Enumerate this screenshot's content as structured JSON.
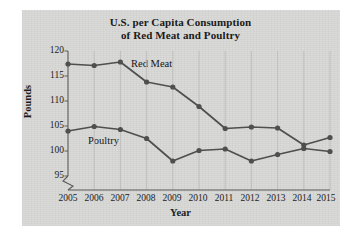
{
  "figure": {
    "title_line1": "U.S. per Capita Consumption",
    "title_line2": "of Red Meat and Poultry",
    "panel_color": "#d9d9d7",
    "ink_color": "#4f4f4f",
    "text_color": "#1c1c1c"
  },
  "chart_data": {
    "type": "line",
    "title": "U.S. per Capita Consumption of Red Meat and Poultry",
    "xlabel": "Year",
    "ylabel": "Pounds",
    "categories": [
      "2005",
      "2006",
      "2007",
      "2008",
      "2009",
      "2010",
      "2011",
      "2012",
      "2013",
      "2014",
      "2015"
    ],
    "x": [
      2005,
      2006,
      2007,
      2008,
      2009,
      2010,
      2011,
      2012,
      2013,
      2014,
      2015
    ],
    "xlim": [
      2005,
      2015
    ],
    "ylim": [
      95,
      120
    ],
    "yticks": [
      95,
      100,
      105,
      110,
      115,
      120
    ],
    "xticks": [
      "2005",
      "2006",
      "2007",
      "2008",
      "2009",
      "2010",
      "2011",
      "2012",
      "2013",
      "2014",
      "2015"
    ],
    "grid": "vertical",
    "y_axis_break": true,
    "legend": "inline-labels",
    "series": [
      {
        "name": "Red Meat",
        "color": "#4f4f4f",
        "values": [
          117.4,
          117.1,
          117.8,
          113.8,
          112.8,
          108.9,
          104.5,
          104.8,
          104.6,
          101.2,
          102.7
        ]
      },
      {
        "name": "Poultry",
        "color": "#4f4f4f",
        "values": [
          104.0,
          104.9,
          104.3,
          102.5,
          98.0,
          100.1,
          100.4,
          98.0,
          99.3,
          100.5,
          99.9
        ]
      }
    ],
    "annotations": [
      {
        "text": "Red Meat",
        "x": 2008,
        "y": 116.5
      },
      {
        "text": "Poultry",
        "x": 2006.5,
        "y": 102.2
      }
    ]
  },
  "yticks": {
    "t0": "95",
    "t1": "100",
    "t2": "105",
    "t3": "110",
    "t4": "115",
    "t5": "120"
  },
  "xticks": {
    "t0": "2005",
    "t1": "2006",
    "t2": "2007",
    "t3": "2008",
    "t4": "2009",
    "t5": "2010",
    "t6": "2011",
    "t7": "2012",
    "t8": "2013",
    "t9": "2014",
    "t10": "2015"
  }
}
